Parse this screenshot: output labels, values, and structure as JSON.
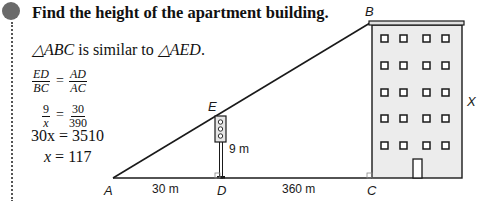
{
  "problem": {
    "title": "Find the height of the apartment building.",
    "similarity": {
      "tri1": "△ABC",
      "middle": " is similar to ",
      "tri2": "△AED",
      "end": "."
    },
    "equations": {
      "proportion1": {
        "left_num": "ED",
        "left_den": "BC",
        "equals": "=",
        "right_num": "AD",
        "right_den": "AC"
      },
      "proportion2": {
        "left_num": "9",
        "left_den": "x",
        "equals": "=",
        "right_num": "30",
        "right_den": "390"
      },
      "line3": {
        "lhs": "30x",
        "equals": "= 3510"
      },
      "line4": {
        "lhs": "x",
        "equals": "= 117"
      }
    }
  },
  "diagram": {
    "points": {
      "A": "A",
      "B": "B",
      "C": "C",
      "D": "D",
      "E": "E"
    },
    "measures": {
      "AD": "30 m",
      "DC": "360 m",
      "ED": "9 m",
      "BC": "X"
    },
    "colors": {
      "line": "#1a1a1a",
      "building_fill": "#ececec",
      "bullet": "#6a6a6a"
    }
  }
}
